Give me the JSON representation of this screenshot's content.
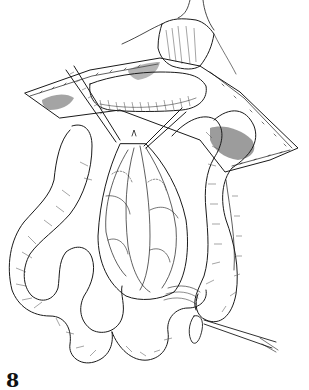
{
  "figure": {
    "label": "8",
    "colors": {
      "ink": "#1a1a1a",
      "shading_dark": "#5a5a5a",
      "shading_mid": "#9a9a9a",
      "background": "#ffffff"
    }
  }
}
